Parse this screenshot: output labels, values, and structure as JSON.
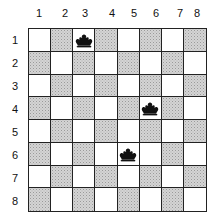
{
  "board": {
    "rows": 8,
    "cols": 8,
    "column_labels": [
      "1",
      "2",
      "3",
      "4",
      "5",
      "6",
      "7",
      "8"
    ],
    "row_labels": [
      "1",
      "2",
      "3",
      "4",
      "5",
      "6",
      "7",
      "8"
    ],
    "shading_rule": "shaded when (row + col) is odd; occupied squares drawn white",
    "colors": {
      "light": "#ffffff",
      "shaded": "#c8c8c8",
      "grid": "#222222",
      "piece": "#111111"
    },
    "pieces": [
      {
        "type": "crown-icon",
        "row": 1,
        "col": 3
      },
      {
        "type": "crown-icon",
        "row": 4,
        "col": 6
      },
      {
        "type": "crown-icon",
        "row": 6,
        "col": 5
      }
    ]
  }
}
